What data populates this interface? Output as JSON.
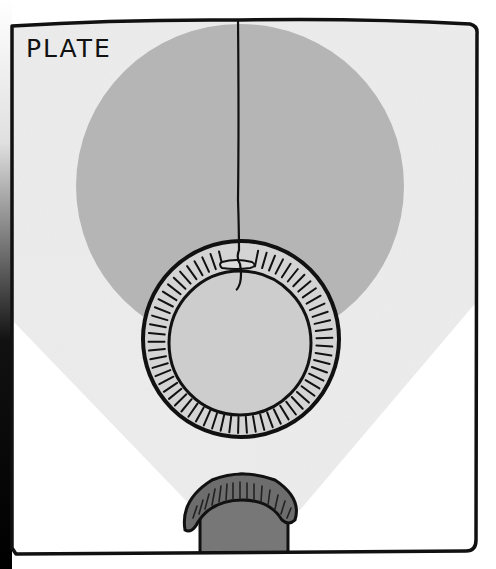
{
  "panel": {
    "title": "PLATE",
    "colors": {
      "paper": "#ffffff",
      "light_beam": "#eeeeee",
      "plate_disc": "#b4b4b4",
      "ring_fill": "#d6d6d6",
      "ring_inner": "#cfcfcf",
      "lamp": "#7a7a7a",
      "ink": "#111111"
    },
    "elements": [
      {
        "name": "plate-disc",
        "shape": "circle",
        "description": "large gray plate disc"
      },
      {
        "name": "hanging-string",
        "shape": "line",
        "description": "string hanging from top border"
      },
      {
        "name": "ring",
        "shape": "annulus",
        "description": "hatched ring tied to string"
      },
      {
        "name": "light-beam",
        "shape": "cone",
        "description": "pale beam from lamp upward"
      },
      {
        "name": "lamp",
        "shape": "dome",
        "description": "dome lamp at bottom"
      }
    ]
  }
}
